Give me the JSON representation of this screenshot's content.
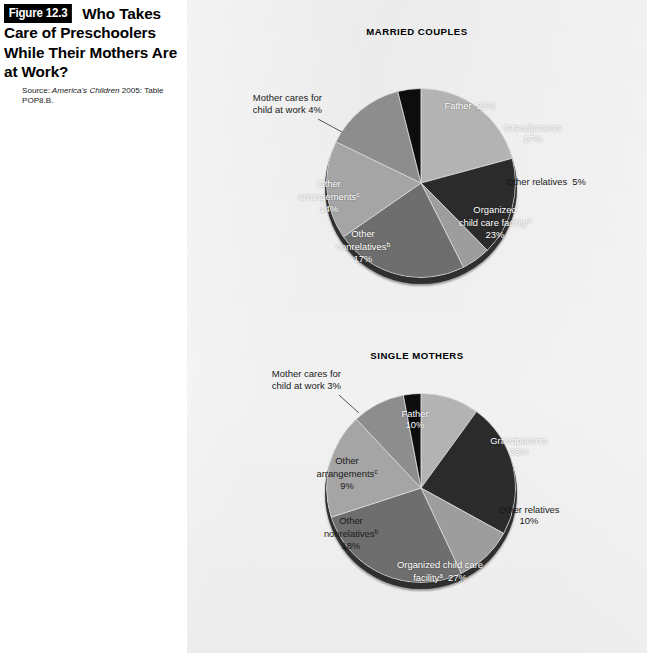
{
  "figure": {
    "badge": "Figure 12.3",
    "title": "Who Takes Care of Preschoolers While Their Mothers Are at Work?",
    "source_prefix": "Source:",
    "source_italic": "America's Children",
    "source_rest": "2005: Table POP8.B."
  },
  "chart_data": {
    "type": "pie",
    "title": "Who Takes Care of Preschoolers While Their Mothers Are at Work?",
    "source": "America's Children 2005: Table POP8.B.",
    "unit": "percent",
    "legend_position": "none (labels on slices)",
    "grid": false,
    "charts": [
      {
        "title": "MARRIED COUPLES",
        "start_angle_deg": 0,
        "direction": "clockwise",
        "categories": [
          "Father",
          "Grandparents",
          "Other relatives",
          "Organized child care facility",
          "Other nonrelatives",
          "Other arrangements",
          "Mother cares for child at work"
        ],
        "values": [
          21,
          17,
          5,
          23,
          17,
          14,
          4
        ],
        "slices": [
          {
            "label": "Father",
            "value": 21,
            "value_text": "21%",
            "footnote": "",
            "color": "#b3b3b3",
            "label_style": "inline",
            "text_color": "#ffffff"
          },
          {
            "label": "Grandparents",
            "value": 17,
            "value_text": "17%",
            "footnote": "",
            "color": "#2b2b2b",
            "label_style": "stacked",
            "text_color": "#ffffff"
          },
          {
            "label": "Other relatives",
            "value": 5,
            "value_text": "5%",
            "footnote": "",
            "color": "#9d9d9d",
            "label_style": "inline",
            "text_color": "#1a1a1a"
          },
          {
            "label": "Organized child care facility",
            "value": 23,
            "value_text": "23%",
            "footnote": "a",
            "color": "#6e6e6e",
            "label_style": "stacked",
            "text_color": "#ffffff"
          },
          {
            "label": "Other nonrelatives",
            "value": 17,
            "value_text": "17%",
            "footnote": "b",
            "color": "#a5a5a5",
            "label_style": "stacked",
            "text_color": "#ffffff"
          },
          {
            "label": "Other arrangements",
            "value": 14,
            "value_text": "14%",
            "footnote": "c",
            "color": "#8d8d8d",
            "label_style": "stacked",
            "text_color": "#ffffff"
          },
          {
            "label": "Mother cares for child at work",
            "value": 4,
            "value_text": "4%",
            "footnote": "",
            "color": "#0d0d0d",
            "label_style": "callout",
            "text_color": "#1a1a1a"
          }
        ],
        "callout": {
          "line1": "Mother cares for",
          "line2": "child at work  4%"
        }
      },
      {
        "title": "SINGLE MOTHERS",
        "start_angle_deg": 0,
        "direction": "clockwise",
        "categories": [
          "Father",
          "Grandparents",
          "Other relatives",
          "Organized child care facility",
          "Other nonrelatives",
          "Other arrangements",
          "Mother cares for child at work"
        ],
        "values": [
          10,
          23,
          10,
          27,
          18,
          9,
          3
        ],
        "slices": [
          {
            "label": "Father",
            "value": 10,
            "value_text": "10%",
            "footnote": "",
            "color": "#b3b3b3",
            "label_style": "stacked",
            "text_color": "#ffffff"
          },
          {
            "label": "Grandparents",
            "value": 23,
            "value_text": "23%",
            "footnote": "",
            "color": "#2b2b2b",
            "label_style": "stacked",
            "text_color": "#ffffff"
          },
          {
            "label": "Other relatives",
            "value": 10,
            "value_text": "10%",
            "footnote": "",
            "color": "#9d9d9d",
            "label_style": "stacked",
            "text_color": "#1a1a1a"
          },
          {
            "label": "Organized child care facility",
            "value": 27,
            "value_text": "27%",
            "footnote": "a",
            "color": "#6e6e6e",
            "label_style": "inline",
            "text_color": "#ffffff"
          },
          {
            "label": "Other nonrelatives",
            "value": 18,
            "value_text": "18%",
            "footnote": "b",
            "color": "#a5a5a5",
            "label_style": "stacked",
            "text_color": "#1a1a1a"
          },
          {
            "label": "Other arrangements",
            "value": 9,
            "value_text": "9%",
            "footnote": "c",
            "color": "#8d8d8d",
            "label_style": "stacked",
            "text_color": "#1a1a1a"
          },
          {
            "label": "Mother cares for child at work",
            "value": 3,
            "value_text": "3%",
            "footnote": "",
            "color": "#0d0d0d",
            "label_style": "callout",
            "text_color": "#1a1a1a"
          }
        ],
        "callout": {
          "line1": "Mother cares for",
          "line2": "child at work  3%"
        }
      }
    ]
  }
}
